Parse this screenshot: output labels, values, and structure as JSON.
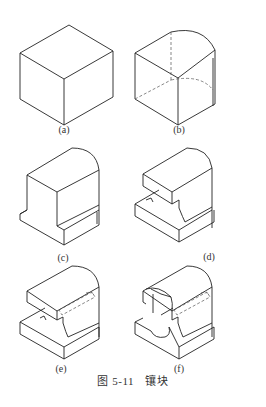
{
  "figure": {
    "number": "图 5-11",
    "title": "镶块",
    "full_caption": "图 5-11　镶块"
  },
  "subfigures": [
    {
      "id": "a",
      "label": "(a)",
      "description": "cube"
    },
    {
      "id": "b",
      "label": "(b)",
      "description": "block with rounded back corner, hidden lines dashed"
    },
    {
      "id": "c",
      "label": "(c)",
      "description": "block with bottom step cut"
    },
    {
      "id": "d",
      "label": "(d)",
      "description": "block with horizontal slot cut"
    },
    {
      "id": "e",
      "label": "(e)",
      "description": "slotted block with hidden hole"
    },
    {
      "id": "f",
      "label": "(f)",
      "description": "slotted block with semicircular cutouts and hidden hole"
    }
  ]
}
